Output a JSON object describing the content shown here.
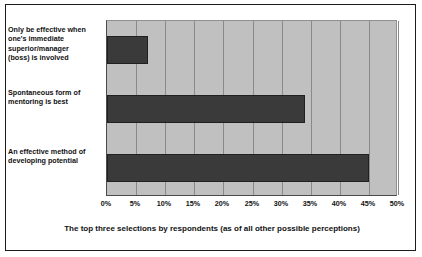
{
  "chart_data": {
    "type": "bar",
    "orientation": "horizontal",
    "title": "",
    "subtitle": "",
    "xlabel": "The top three selections by respondents (as of all other possible perceptions)",
    "ylabel": "",
    "categories": [
      "An effective method of developing potential",
      "Spontaneous form of mentoring is best",
      "Only be effective when one's immediate superior/manager (boss) is involved"
    ],
    "values": [
      45,
      34,
      7
    ],
    "value_unit": "%",
    "xlim": [
      0,
      50
    ],
    "xtick_values": [
      0,
      5,
      10,
      15,
      20,
      25,
      30,
      35,
      40,
      45,
      50
    ],
    "xtick_labels": [
      "0%",
      "5%",
      "10%",
      "15%",
      "20%",
      "25%",
      "30%",
      "35%",
      "40%",
      "45%",
      "50%"
    ],
    "grid": true,
    "grid_axis": "x",
    "legend": false,
    "legend_position": "none",
    "bar_color": "#3a3a3a",
    "plot_background_color": "#c0c0c0",
    "figure_background_color": "#ffffff",
    "gridline_color": "#8a8a8a",
    "border_color": "#1c1c1c"
  },
  "category_lines": [
    [
      "An effective method of",
      "developing potential"
    ],
    [
      "Spontaneous form of",
      "mentoring is best"
    ],
    [
      "Only be effective when",
      "one's immediate",
      "superior/manager",
      "(boss) is involved"
    ]
  ],
  "labels": {
    "cat_0_line_0": "An effective method of",
    "cat_0_line_1": "developing potential",
    "cat_1_line_0": "Spontaneous form of",
    "cat_1_line_1": "mentoring is best",
    "cat_2_line_0": "Only be effective when",
    "cat_2_line_1": "one's immediate",
    "cat_2_line_2": "superior/manager",
    "cat_2_line_3": "(boss) is involved"
  },
  "ticks": {
    "t0": "0%",
    "t1": "5%",
    "t2": "10%",
    "t3": "15%",
    "t4": "20%",
    "t5": "25%",
    "t6": "30%",
    "t7": "35%",
    "t8": "40%",
    "t9": "45%",
    "t10": "50%"
  },
  "axis_title": "The top three selections by respondents (as of all other possible perceptions)"
}
